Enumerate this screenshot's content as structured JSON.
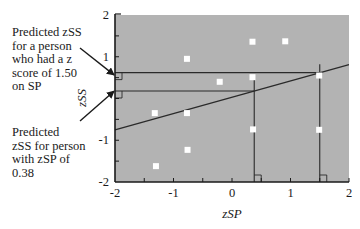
{
  "chart_data": {
    "type": "scatter",
    "title": "",
    "xlabel": "zSP",
    "ylabel": "zSS",
    "xlim": [
      -2,
      2
    ],
    "ylim": [
      -2,
      2
    ],
    "x_ticks": [
      -2,
      -1,
      0,
      1,
      2
    ],
    "x_tick_labels": [
      "-2",
      "-1",
      "0",
      "1",
      "2"
    ],
    "y_ticks": [
      -2,
      -1,
      1,
      2
    ],
    "y_tick_labels": [
      "-2",
      "-1",
      "1",
      "2"
    ],
    "minor_tick_step": 0.5,
    "grid": false,
    "background": "#b3b3b3",
    "point_color": "#ffffff",
    "line_color": "#2a2a2a",
    "points": [
      {
        "x": -1.32,
        "y": -0.35
      },
      {
        "x": -1.3,
        "y": -1.62
      },
      {
        "x": -0.77,
        "y": 0.95
      },
      {
        "x": -0.77,
        "y": -0.35
      },
      {
        "x": -0.76,
        "y": -1.23
      },
      {
        "x": -0.21,
        "y": 0.4
      },
      {
        "x": 0.35,
        "y": 1.36
      },
      {
        "x": 0.35,
        "y": 0.51
      },
      {
        "x": 0.36,
        "y": -0.74
      },
      {
        "x": 0.91,
        "y": 1.37
      },
      {
        "x": 1.49,
        "y": 0.55
      },
      {
        "x": 1.49,
        "y": -0.75
      }
    ],
    "regression_line": {
      "slope": 0.39,
      "intercept": 0.03,
      "x_start": -2,
      "x_end": 2
    },
    "prediction_guides": [
      {
        "x": 0.38,
        "predicted_y": 0.18,
        "vertical_top_y": 0.45,
        "label": "Predicted zSS for person with zSP of 0.38"
      },
      {
        "x": 1.5,
        "predicted_y": 0.62,
        "vertical_top_y": 0.82,
        "label": "Predicted zSS for a person who had a z score of 1.50 on SP"
      }
    ],
    "annotations": [
      {
        "id": "top",
        "text": "Predicted zSS\nfor a person\nwho had a z\nscore of 1.50\non SP",
        "arrow_to": {
          "x": -2,
          "y": 0.59
        }
      },
      {
        "id": "bottom",
        "text": "Predicted\nzSS for person\nwith zSP of\n0.38",
        "arrow_to": {
          "x": -2,
          "y": 0.15
        }
      }
    ],
    "legend": null
  }
}
